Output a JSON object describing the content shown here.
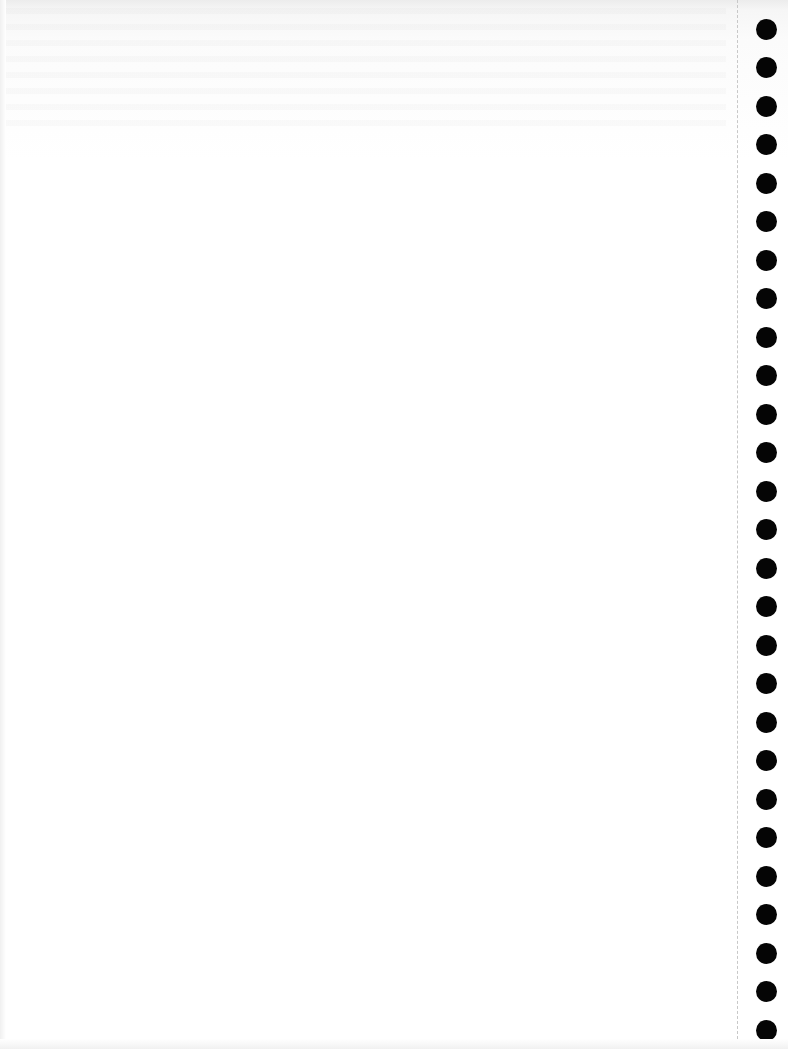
{
  "document": {
    "type": "blank continuous-form page",
    "text": "",
    "binder_holes": {
      "count": 28,
      "side": "right",
      "color": "#050505",
      "first_top_px": 29,
      "spacing_px": 38.5,
      "diameter_px": 21
    },
    "perforation": {
      "style": "dashed",
      "x_px": 737,
      "color": "#c8c8c8"
    },
    "background_color": "#ffffff"
  }
}
